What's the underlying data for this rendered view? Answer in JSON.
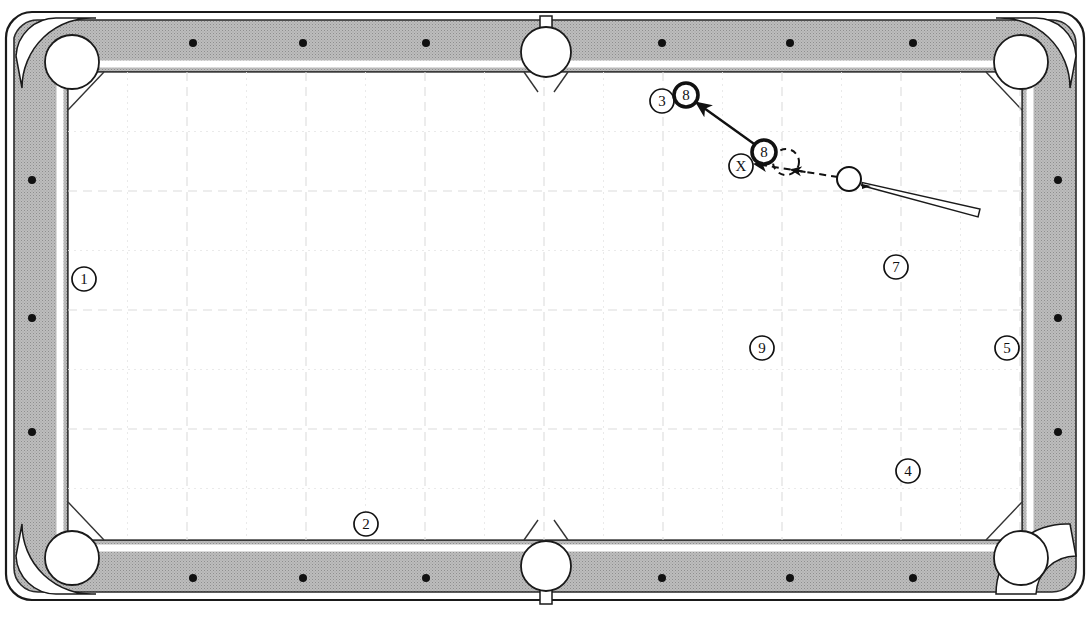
{
  "diagram": {
    "type": "billiards-shot-diagram",
    "table": {
      "name": "pool-table",
      "frame_color": "#ffffff",
      "rail_color": "#b9b9b9",
      "rail_outline": "#1a1a1a",
      "cloth_color": "#ffffff",
      "cushion_color": "#ffffff",
      "grid_color": "#d8d8d8",
      "outer": {
        "x": 6,
        "y": 12,
        "w": 1078,
        "h": 588,
        "r": 26
      },
      "rail_inner": {
        "x": 30,
        "y": 36,
        "w": 1030,
        "h": 540,
        "r": 18
      },
      "playfield": {
        "x": 68,
        "y": 72,
        "w": 954,
        "h": 468
      }
    },
    "grid": {
      "name": "playfield-grid",
      "major_spacing": 119,
      "minor_spacing": 59.5,
      "major_color": "#dcdcdc",
      "minor_color": "#e8e8e8"
    },
    "pockets": [
      {
        "name": "pocket-top-left",
        "kind": "corner",
        "cx": 72,
        "cy": 62
      },
      {
        "name": "pocket-top-middle",
        "kind": "side",
        "cx": 546,
        "cy": 52
      },
      {
        "name": "pocket-top-right",
        "kind": "corner",
        "cx": 1021,
        "cy": 62
      },
      {
        "name": "pocket-bottom-left",
        "kind": "corner",
        "cx": 72,
        "cy": 558
      },
      {
        "name": "pocket-bottom-middle",
        "kind": "side",
        "cx": 546,
        "cy": 566
      },
      {
        "name": "pocket-bottom-right",
        "kind": "corner",
        "cx": 1021,
        "cy": 558
      }
    ],
    "diamonds": {
      "name": "rail-diamonds",
      "color": "#111111",
      "top": [
        193,
        303,
        426,
        662,
        790,
        913
      ],
      "bottom": [
        193,
        303,
        426,
        662,
        790,
        913
      ],
      "left": [
        180,
        318,
        432
      ],
      "right": [
        180,
        318,
        432
      ],
      "top_y": 43,
      "bottom_y": 578,
      "left_x": 32,
      "right_x": 1058
    },
    "balls": [
      {
        "name": "ball-1",
        "label": "1",
        "cx": 84,
        "cy": 279,
        "style": "thin",
        "r": 12
      },
      {
        "name": "ball-2",
        "label": "2",
        "cx": 366,
        "cy": 524,
        "style": "thin",
        "r": 12
      },
      {
        "name": "ball-9",
        "label": "9",
        "cx": 762,
        "cy": 348,
        "style": "thin",
        "r": 12
      },
      {
        "name": "ball-4",
        "label": "4",
        "cx": 908,
        "cy": 471,
        "style": "thin",
        "r": 12
      },
      {
        "name": "ball-5",
        "label": "5",
        "cx": 1007,
        "cy": 348,
        "style": "thin",
        "r": 12
      },
      {
        "name": "ball-7",
        "label": "7",
        "cx": 896,
        "cy": 267,
        "style": "thin",
        "r": 12
      },
      {
        "name": "ball-3",
        "label": "3",
        "cx": 662,
        "cy": 101,
        "style": "thin",
        "r": 12
      },
      {
        "name": "ball-8-target",
        "label": "8",
        "cx": 764,
        "cy": 152,
        "style": "bold",
        "r": 12
      },
      {
        "name": "ball-8-destination",
        "label": "8",
        "cx": 686,
        "cy": 95,
        "style": "bold",
        "r": 12
      }
    ],
    "markers": [
      {
        "name": "x-marker",
        "label": "X",
        "cx": 741,
        "cy": 166,
        "r": 12
      }
    ],
    "cue_ball": {
      "name": "cue-ball",
      "cx": 849,
      "cy": 179,
      "r": 12
    },
    "ghost_ball": {
      "name": "ghost-ball",
      "cx": 786,
      "cy": 162,
      "r": 13
    },
    "cue_stick": {
      "name": "cue-stick",
      "tip_x": 862,
      "tip_y": 184,
      "butt_x": 979,
      "butt_y": 213,
      "tip_width": 3,
      "butt_width": 8
    },
    "shot_paths": [
      {
        "name": "object-ball-path",
        "style": "solid",
        "from_x": 757,
        "from_y": 146,
        "to_x": 697,
        "to_y": 103,
        "arrow": "end"
      },
      {
        "name": "cue-ball-path",
        "style": "dashed",
        "from_x": 838,
        "from_y": 177,
        "to_x": 755,
        "to_y": 164,
        "arrow": "mid-and-end"
      }
    ]
  }
}
